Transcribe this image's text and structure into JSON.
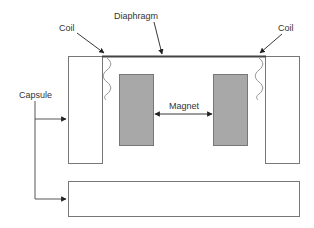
{
  "diagram": {
    "type": "microphone-capsule-cross-section",
    "colors": {
      "outline": "#777777",
      "diaphragm": "#444444",
      "magnet_fill": "#a8a8a8",
      "arrow": "#222222",
      "text": "#333333"
    },
    "labels": {
      "diaphragm": "Diaphragm",
      "coil_left": "Coil",
      "coil_right": "Coil",
      "capsule": "Capsule",
      "magnet": "Magnet"
    },
    "components": [
      {
        "id": "capsule-left-wall",
        "label": "Capsule"
      },
      {
        "id": "capsule-right-wall",
        "label": "Capsule"
      },
      {
        "id": "capsule-base",
        "label": "Capsule"
      },
      {
        "id": "diaphragm",
        "label": "Diaphragm"
      },
      {
        "id": "coil-left",
        "label": "Coil"
      },
      {
        "id": "coil-right",
        "label": "Coil"
      },
      {
        "id": "magnet-left",
        "label": "Magnet"
      },
      {
        "id": "magnet-right",
        "label": "Magnet"
      }
    ]
  }
}
